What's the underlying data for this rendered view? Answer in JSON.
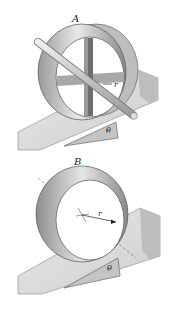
{
  "figures": [
    {
      "id": "A",
      "label": "A",
      "radius_label": "r",
      "angle_label": "θ",
      "description": "Cylindrical shell with cross spokes and axle rolling on incline"
    },
    {
      "id": "B",
      "label": "B",
      "radius_label": "r",
      "angle_label": "θ",
      "description": "Thin cylindrical hoop rolling on incline"
    }
  ],
  "colors": {
    "background": "#ffffff",
    "shell_light": "#e6e6e6",
    "shell_dark": "#8c8c8c",
    "incline_top": "#dcdcdc",
    "incline_side": "#bdbdbd",
    "axle": "#cfcfcf",
    "outline": "#555555"
  }
}
